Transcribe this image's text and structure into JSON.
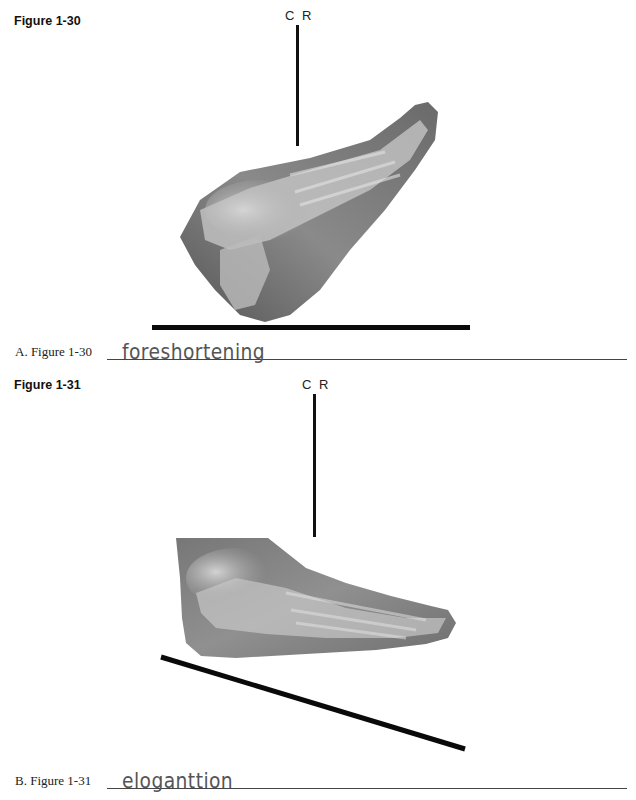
{
  "page": {
    "cutoff_header": "",
    "figures": [
      {
        "id": "fig-1-30",
        "label": "Figure 1-30",
        "central_ray_label": "C R",
        "description": "Lateral x-ray of foot angled upward (toes raised), vertical central ray, horizontal image receptor line"
      },
      {
        "id": "fig-1-31",
        "label": "Figure 1-31",
        "central_ray_label": "C R",
        "description": "Lateral x-ray of foot flat, vertical central ray, image receptor line slanted downward"
      }
    ],
    "answers": [
      {
        "label": "A.  Figure 1-30",
        "handwritten": "foreshortening"
      },
      {
        "label": "B.  Figure 1-31",
        "handwritten": "eloganttion"
      }
    ]
  }
}
